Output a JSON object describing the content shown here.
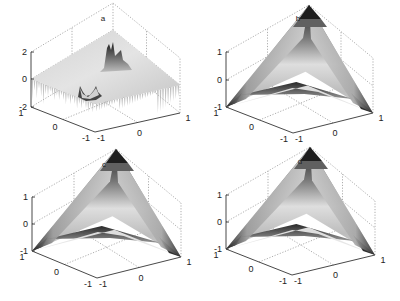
{
  "figure": {
    "background": "#ffffff",
    "panel_count": 4
  },
  "chart_data": [
    {
      "type": "surface3d",
      "title": "a",
      "description": "Noisy nearly-flat surface near z=0 with a sharp peak cluster (~z=2) toward the back and a dip/spike cluster near the center; spiky edges down to z=-2",
      "xlabel": "",
      "ylabel": "",
      "zlabel": "",
      "x_ticks": [
        "-1",
        "0",
        "1"
      ],
      "y_ticks": [
        "-1",
        "0",
        "1"
      ],
      "z_ticks": [
        "-2",
        "0",
        "2"
      ],
      "xlim": [
        -1,
        1
      ],
      "ylim": [
        -1,
        1
      ],
      "zlim": [
        -2,
        2
      ],
      "grid": true,
      "colormap": "gray"
    },
    {
      "type": "surface3d",
      "title": "b",
      "description": "Saddle / hyperbolic-paraboloid-like surface: z=+1 at back corner and front corner, z=-1 at left and right corners",
      "x_ticks": [
        "-1",
        "0",
        "1"
      ],
      "y_ticks": [
        "-1",
        "0",
        "1"
      ],
      "z_ticks": [
        "-1",
        "0",
        "1"
      ],
      "xlim": [
        -1,
        1
      ],
      "ylim": [
        -1,
        1
      ],
      "zlim": [
        -1,
        1
      ],
      "grid": true,
      "colormap": "gray"
    },
    {
      "type": "surface3d",
      "title": "c",
      "description": "Saddle surface similar to b (reconstruction)",
      "x_ticks": [
        "-1",
        "0",
        "1"
      ],
      "y_ticks": [
        "-1",
        "0",
        "1"
      ],
      "z_ticks": [
        "-1",
        "0",
        "1"
      ],
      "xlim": [
        -1,
        1
      ],
      "ylim": [
        -1,
        1
      ],
      "zlim": [
        -1,
        1
      ],
      "grid": true,
      "colormap": "gray"
    },
    {
      "type": "surface3d",
      "title": "d",
      "description": "Saddle surface similar to b (reconstruction)",
      "x_ticks": [
        "-1",
        "0",
        "1"
      ],
      "y_ticks": [
        "-1",
        "0",
        "1"
      ],
      "z_ticks": [
        "-1",
        "0",
        "1"
      ],
      "xlim": [
        -1,
        1
      ],
      "ylim": [
        -1,
        1
      ],
      "zlim": [
        -1,
        1
      ],
      "grid": true,
      "colormap": "gray"
    }
  ],
  "panels": [
    {
      "title": "a",
      "z_ticks": [
        "2",
        "0",
        "-2"
      ],
      "y_ticks": [
        "1",
        "0",
        "-1"
      ],
      "x_ticks": [
        "-1",
        "0",
        "1"
      ]
    },
    {
      "title": "b",
      "z_ticks": [
        "1",
        "0",
        "-1"
      ],
      "y_ticks": [
        "1",
        "0",
        "-1"
      ],
      "x_ticks": [
        "-1",
        "0",
        "1"
      ]
    },
    {
      "title": "c",
      "z_ticks": [
        "1",
        "0",
        "-1"
      ],
      "y_ticks": [
        "1",
        "0",
        "-1"
      ],
      "x_ticks": [
        "-1",
        "0",
        "1"
      ]
    },
    {
      "title": "d",
      "z_ticks": [
        "1",
        "0",
        "-1"
      ],
      "y_ticks": [
        "1",
        "0",
        "-1"
      ],
      "x_ticks": [
        "-1",
        "0",
        "1"
      ]
    }
  ]
}
